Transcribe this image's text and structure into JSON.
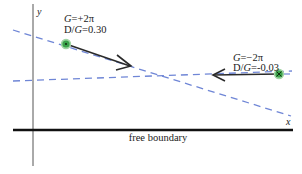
{
  "diagram": {
    "axes": {
      "x_label": "x",
      "y_label": "y",
      "boundary_label": "free boundary"
    },
    "vortices": [
      {
        "id": "vortex-left",
        "G_symbol": "G",
        "G_value": "=+2π",
        "ratio_D": "D/",
        "ratio_G": "G",
        "ratio_value": "=0.30",
        "direction": "right-down"
      },
      {
        "id": "vortex-right",
        "G_symbol": "G",
        "G_value": "=−2π",
        "ratio_D": "D/",
        "ratio_G": "G",
        "ratio_value": "=-0.03",
        "direction": "left"
      }
    ],
    "colors": {
      "axis": "#111111",
      "dashed_line": "#6f86d6",
      "arrow": "#2a2a2a",
      "marker_fill": "#3aa24a",
      "marker_ring": "#9fd4a2"
    }
  }
}
